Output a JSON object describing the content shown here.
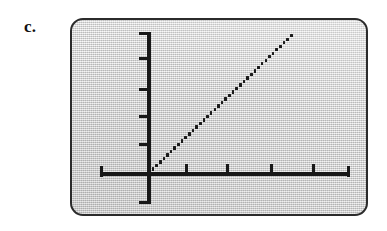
{
  "figure": {
    "part_label": "c.",
    "panel_border_color": "#2b2b2b",
    "panel_fill_color": "#d8d8d8",
    "ink_color": "#181818"
  },
  "chart_data": {
    "type": "line",
    "title": "",
    "subtitle": "",
    "xlabel": "",
    "ylabel": "",
    "style": "dotted",
    "grid": false,
    "legend": null,
    "axis_style": "crossing axes through origin with unlabeled tick marks",
    "tick_labels_visible": false,
    "origin": {
      "x": 0,
      "y": 0
    },
    "xlim": [
      -2,
      6
    ],
    "ylim": [
      -1.5,
      6
    ],
    "x_ticks": [
      -2,
      1,
      2,
      3,
      4,
      5
    ],
    "y_ticks": [
      -1.5,
      1,
      2,
      3,
      4,
      5
    ],
    "x_tick_labels": [
      "",
      "",
      "",
      "",
      "",
      ""
    ],
    "y_tick_labels": [
      "",
      "",
      "",
      "",
      "",
      ""
    ],
    "series": [
      {
        "name": "line",
        "description": "straight dotted line of positive slope through the origin",
        "slope": 1,
        "intercept": 0,
        "x": [
          0,
          0.5,
          1,
          1.5,
          2,
          2.5,
          3,
          3.5,
          4
        ],
        "y": [
          0,
          0.5,
          1,
          1.5,
          2,
          2.5,
          3,
          3.5,
          4
        ]
      }
    ],
    "annotations": []
  },
  "render": {
    "dot_count": 40,
    "line_start_px": {
      "x": 76,
      "y": 151
    },
    "line_end_px": {
      "x": 218,
      "y": 14
    },
    "x_tick_positions_px": [
      113,
      154,
      198,
      240
    ],
    "y_tick_positions_px": [
      37,
      68,
      95,
      123
    ]
  }
}
